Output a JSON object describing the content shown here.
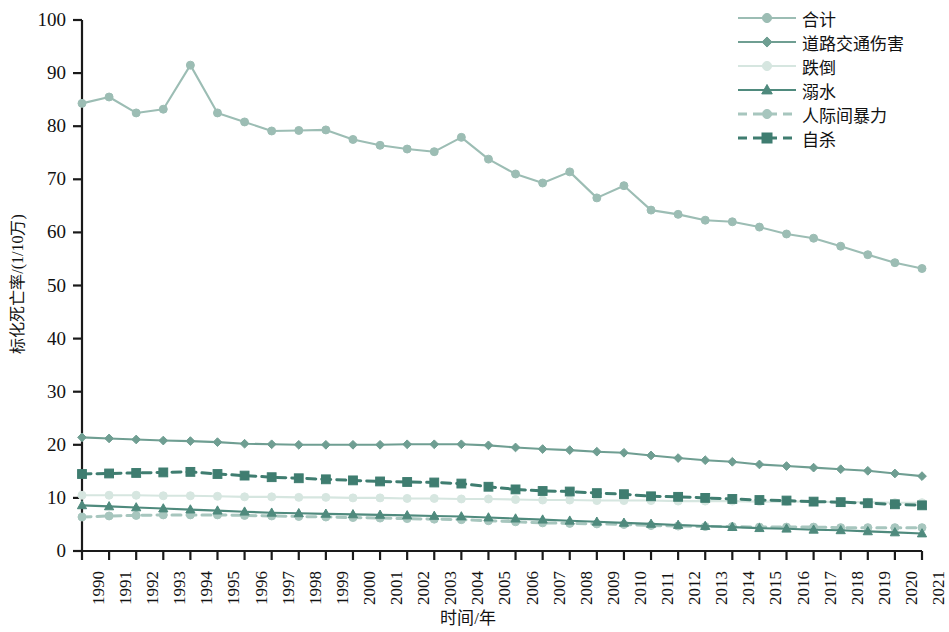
{
  "chart_data": {
    "type": "line",
    "title": "",
    "xlabel": "时间/年",
    "ylabel": "标化死亡率/(1/10万)",
    "xlim": [
      1990,
      2021
    ],
    "ylim": [
      0,
      100
    ],
    "yticks": [
      0,
      10,
      20,
      30,
      40,
      50,
      60,
      70,
      80,
      90,
      100
    ],
    "grid": false,
    "legend_position": "top-right",
    "x": [
      1990,
      1991,
      1992,
      1993,
      1994,
      1995,
      1996,
      1997,
      1998,
      1999,
      2000,
      2001,
      2002,
      2003,
      2004,
      2005,
      2006,
      2007,
      2008,
      2009,
      2010,
      2011,
      2012,
      2013,
      2014,
      2015,
      2016,
      2017,
      2018,
      2019,
      2020,
      2021
    ],
    "categories": [
      "1990",
      "1991",
      "1992",
      "1993",
      "1994",
      "1995",
      "1996",
      "1997",
      "1998",
      "1999",
      "2000",
      "2001",
      "2002",
      "2003",
      "2004",
      "2005",
      "2006",
      "2007",
      "2008",
      "2009",
      "2010",
      "2011",
      "2012",
      "2013",
      "2014",
      "2015",
      "2016",
      "2017",
      "2018",
      "2019",
      "2020",
      "2021"
    ],
    "series": [
      {
        "name": "合计",
        "color": "#9cbdb4",
        "marker": "circle",
        "dash": "solid",
        "values": [
          84.3,
          85.5,
          82.5,
          83.2,
          91.5,
          82.5,
          80.8,
          79.1,
          79.2,
          79.3,
          77.5,
          76.4,
          75.7,
          75.2,
          77.9,
          73.8,
          71.0,
          69.3,
          71.4,
          66.5,
          68.8,
          64.2,
          63.4,
          62.3,
          62.0,
          61.0,
          59.7,
          58.9,
          57.4,
          55.8,
          54.3,
          53.2
        ]
      },
      {
        "name": "道路交通伤害",
        "color": "#6f9e92",
        "marker": "diamond",
        "dash": "solid",
        "values": [
          21.4,
          21.2,
          21.0,
          20.8,
          20.7,
          20.5,
          20.2,
          20.1,
          20.0,
          20.0,
          20.0,
          20.0,
          20.1,
          20.1,
          20.1,
          19.9,
          19.5,
          19.2,
          19.0,
          18.7,
          18.5,
          18.0,
          17.5,
          17.1,
          16.8,
          16.3,
          16.0,
          15.7,
          15.4,
          15.1,
          14.6,
          14.1
        ]
      },
      {
        "name": "跌倒",
        "color": "#d6e6e0",
        "marker": "circle",
        "dash": "solid",
        "values": [
          10.5,
          10.5,
          10.5,
          10.4,
          10.4,
          10.3,
          10.2,
          10.2,
          10.1,
          10.1,
          10.0,
          10.0,
          9.9,
          9.9,
          9.8,
          9.8,
          9.7,
          9.6,
          9.6,
          9.5,
          9.5,
          9.5,
          9.4,
          9.4,
          9.4,
          9.3,
          9.3,
          9.3,
          9.2,
          9.2,
          9.1,
          9.1
        ]
      },
      {
        "name": "溺水",
        "color": "#4f8a7d",
        "marker": "triangle",
        "dash": "solid",
        "values": [
          8.6,
          8.4,
          8.2,
          8.0,
          7.8,
          7.6,
          7.4,
          7.2,
          7.1,
          7.0,
          6.9,
          6.8,
          6.7,
          6.6,
          6.5,
          6.3,
          6.1,
          5.9,
          5.7,
          5.5,
          5.3,
          5.1,
          4.9,
          4.7,
          4.5,
          4.3,
          4.2,
          4.0,
          3.9,
          3.7,
          3.5,
          3.3
        ]
      },
      {
        "name": "人际间暴力",
        "color": "#a7c6be",
        "marker": "circle",
        "dash": "dashed",
        "values": [
          6.4,
          6.6,
          6.7,
          6.8,
          6.8,
          6.8,
          6.7,
          6.6,
          6.5,
          6.4,
          6.3,
          6.2,
          6.1,
          6.0,
          5.9,
          5.7,
          5.5,
          5.3,
          5.2,
          5.1,
          5.0,
          4.8,
          4.7,
          4.6,
          4.6,
          4.5,
          4.5,
          4.5,
          4.4,
          4.4,
          4.4,
          4.4
        ]
      },
      {
        "name": "自杀",
        "color": "#3f7d70",
        "marker": "square",
        "dash": "dashed",
        "values": [
          14.5,
          14.6,
          14.7,
          14.8,
          14.9,
          14.5,
          14.2,
          13.9,
          13.7,
          13.5,
          13.3,
          13.1,
          13.0,
          12.9,
          12.7,
          12.1,
          11.6,
          11.3,
          11.2,
          10.9,
          10.7,
          10.3,
          10.2,
          10.0,
          9.8,
          9.6,
          9.5,
          9.3,
          9.2,
          9.0,
          8.8,
          8.6
        ]
      }
    ]
  },
  "axes": {
    "y_title": "标化死亡率/(1/10万)",
    "x_title": "时间/年"
  }
}
